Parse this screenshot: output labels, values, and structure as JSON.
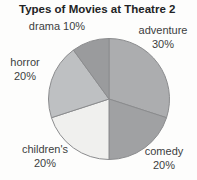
{
  "chart_data": {
    "type": "pie",
    "title": "Types of Movies at Theatre 2",
    "categories": [
      "adventure",
      "comedy",
      "children's",
      "horror",
      "drama"
    ],
    "values": [
      30,
      20,
      20,
      20,
      10
    ],
    "slices": [
      {
        "name": "adventure",
        "value": 30,
        "pct": "30%",
        "color": "#acadaf"
      },
      {
        "name": "comedy",
        "value": 20,
        "pct": "20%",
        "color": "#a0a1a3"
      },
      {
        "name": "children's",
        "value": 20,
        "pct": "20%",
        "color": "#f0f0ee"
      },
      {
        "name": "horror",
        "value": 20,
        "pct": "20%",
        "color": "#bec0c2"
      },
      {
        "name": "drama",
        "value": 10,
        "pct": "10%",
        "color": "#9a9b9d"
      }
    ],
    "start_angle_deg": -90,
    "direction": "clockwise",
    "center": [
      109,
      99
    ],
    "radius": 60.5,
    "stroke_color": "#8b8c8e",
    "legend_position": "none (labels placed outside slices)",
    "label_text_color": "#3c3d3f"
  }
}
